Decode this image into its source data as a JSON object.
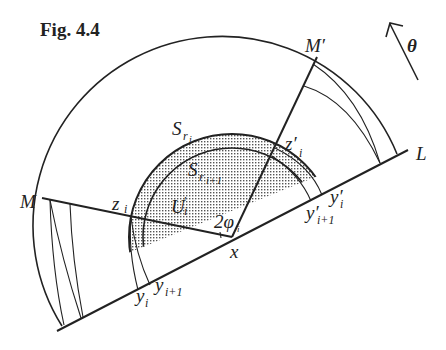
{
  "figure": {
    "title": "Fig. 4.4",
    "direction_label": "θ",
    "line_label": "L",
    "center_label": "x",
    "angle_label": "2φ",
    "angle_sub": "i",
    "points": {
      "M": "M",
      "M_prime": "M′",
      "z": "z",
      "z_sub": "i",
      "z_prime": "z′",
      "z_prime_sub": "i",
      "y_i": "y",
      "y_i_sub": "i",
      "y_i1": "y",
      "y_i1_sub": "i+1",
      "y_prime_i": "y′",
      "y_prime_i_sub": "i",
      "y_prime_i1": "y′",
      "y_prime_i1_sub": "i+1"
    },
    "regions": {
      "S_ri": "S",
      "S_ri_sub": "r",
      "S_ri_subsub": "i",
      "S_ri1": "S",
      "S_ri1_sub": "r",
      "S_ri1_subsub": "i+1",
      "U_i": "U",
      "U_i_sub": "i",
      "U_i_prime": "′"
    },
    "colors": {
      "ink": "#222222",
      "background": "#ffffff"
    }
  }
}
